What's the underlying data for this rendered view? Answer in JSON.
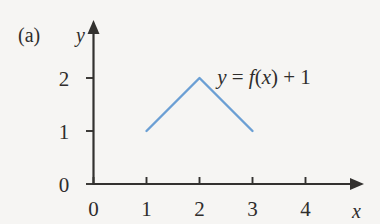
{
  "figure": {
    "panel_label": "(a)",
    "background_color": "#f6f5f3",
    "ink_color": "#2f2d2c",
    "annotation": {
      "full_text": "y = f(x) + 1",
      "part_y": "y",
      "part_equals": " = ",
      "part_f": "f",
      "part_open": "(",
      "part_x": "x",
      "part_close": ")",
      "part_plus": " + ",
      "part_one": "1"
    }
  },
  "chart_data": {
    "type": "line",
    "title": "(a)",
    "xlabel": "x",
    "ylabel": "y",
    "xlim": [
      0,
      4.6
    ],
    "ylim": [
      0,
      2.45
    ],
    "grid": false,
    "legend": null,
    "x_ticks": [
      "0",
      "1",
      "2",
      "3",
      "4"
    ],
    "x_tick_values": [
      0,
      1,
      2,
      3,
      4
    ],
    "y_ticks": [
      "0",
      "1",
      "2"
    ],
    "y_tick_values": [
      0,
      1,
      2
    ],
    "annotations": [
      {
        "text": "y = f(x) + 1",
        "x": 3.0,
        "y": 2.05
      }
    ],
    "series": [
      {
        "name": "y = f(x) + 1",
        "color": "#6b9fd4",
        "x": [
          1,
          2,
          3
        ],
        "values": [
          1,
          2,
          1
        ]
      }
    ]
  }
}
